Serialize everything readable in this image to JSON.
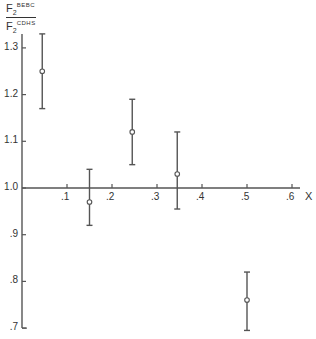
{
  "chart_data": {
    "type": "scatter",
    "title": "",
    "xlabel": "X",
    "ylabel": "F2^BEBC / F2^CDHS",
    "ylabel_parts": {
      "num_base": "F",
      "num_sub": "2",
      "num_sup": "BEBC",
      "den_base": "F",
      "den_sub": "2",
      "den_sup": "CDHS"
    },
    "xlim": [
      0,
      0.65
    ],
    "ylim": [
      0.7,
      1.35
    ],
    "x_ticks": [
      ".1",
      ".2",
      ".3",
      ".4",
      ".5",
      ".6"
    ],
    "x_tick_values": [
      0.1,
      0.2,
      0.3,
      0.4,
      0.5,
      0.6
    ],
    "y_ticks": [
      "1.3",
      "1.2",
      "1.1",
      "1.0",
      ".9",
      ".8",
      ".7"
    ],
    "y_tick_values": [
      1.3,
      1.2,
      1.1,
      1.0,
      0.9,
      0.8,
      0.7
    ],
    "x_axis_crosses_at": 1.0,
    "grid": false,
    "legend": null,
    "series": [
      {
        "name": "F2 ratio with error bars",
        "points": [
          {
            "x": 0.045,
            "y": 1.25,
            "y_low": 1.17,
            "y_high": 1.33
          },
          {
            "x": 0.15,
            "y": 0.97,
            "y_low": 0.92,
            "y_high": 1.04
          },
          {
            "x": 0.245,
            "y": 1.12,
            "y_low": 1.05,
            "y_high": 1.19
          },
          {
            "x": 0.345,
            "y": 1.03,
            "y_low": 0.955,
            "y_high": 1.12
          },
          {
            "x": 0.5,
            "y": 0.76,
            "y_low": 0.695,
            "y_high": 0.82
          }
        ]
      }
    ]
  }
}
